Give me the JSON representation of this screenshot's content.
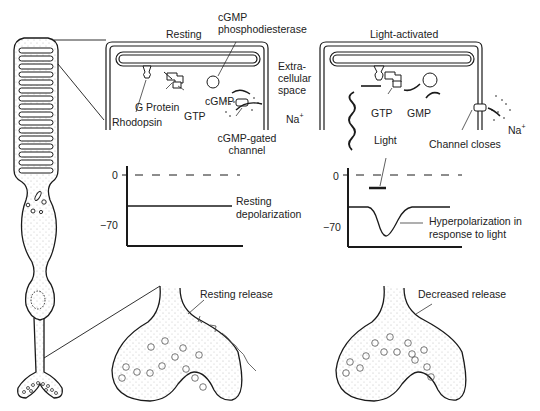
{
  "panels": {
    "resting": {
      "title": "Resting",
      "labels": {
        "pde": "cGMP\nphosphodiesterase",
        "pde_line1": "cGMP",
        "pde_line2": "phosphodiesterase",
        "extracellular_line1": "Extra-",
        "extracellular_line2": "cellular",
        "extracellular_line3": "space",
        "rhodopsin": "Rhodopsin",
        "g_protein": "G Protein",
        "gtp": "GTP",
        "cgmp": "cGMP",
        "channel_line1": "cGMP-gated",
        "channel_line2": "channel",
        "na": "Na",
        "na_charge": "+"
      },
      "potential_graph": {
        "tick_zero": "0",
        "tick_minus70": "−70",
        "trace_label_line1": "Resting",
        "trace_label_line2": "depolarization"
      },
      "terminal_label": "Resting release"
    },
    "light": {
      "title": "Light-activated",
      "labels": {
        "gtp": "GTP",
        "gmp": "GMP",
        "light": "Light",
        "channel_closes": "Channel closes",
        "na": "Na",
        "na_charge": "+"
      },
      "potential_graph": {
        "tick_zero": "0",
        "tick_minus70": "−70",
        "trace_label_line1": "Hyperpolarization in",
        "trace_label_line2": "response to light"
      },
      "terminal_label": "Decreased release"
    }
  },
  "colors": {
    "ink": "#1a1a1a",
    "stipple": "#bdbdbd",
    "background": "#ffffff"
  }
}
